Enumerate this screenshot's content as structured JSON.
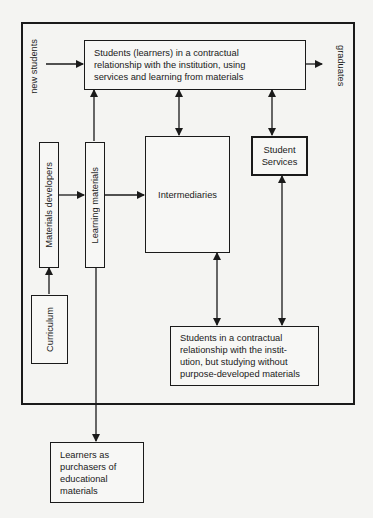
{
  "diagram": {
    "nodes": {
      "enrolled_students": "Students (learners) in a contractual relationship with the institution, using services and learning from materials",
      "intermediaries": "Intermediaries",
      "student_services": "Student Services",
      "materials_developers": "Materials developers",
      "learning_materials": "Learning materials",
      "curriculum": "Curriculum",
      "students_without_materials": "Students in a contractual relationship with the institution, but studying without purpose-developed materials",
      "learners_purchasers": "Learners as purchasers of educational materials"
    },
    "lines": {
      "enrolled_students": [
        "Students (learners) in a contractual",
        "relationship with the institution, using",
        "services and learning from materials"
      ],
      "students_without_materials": [
        "Students in a contractual",
        "relationship with the instit-",
        "ution, but studying without",
        "purpose-developed materials"
      ],
      "learners_purchasers": [
        "Learners as",
        "purchasers of",
        "educational",
        "materials"
      ],
      "student_services": [
        "Student",
        "Services"
      ]
    },
    "edge_labels": {
      "new_students": "new students",
      "graduates": "graduates"
    },
    "edges": [
      {
        "from": "new_students",
        "to": "enrolled_students",
        "type": "arrow"
      },
      {
        "from": "enrolled_students",
        "to": "graduates",
        "type": "arrow"
      },
      {
        "from": "learning_materials",
        "to": "enrolled_students",
        "type": "arrow"
      },
      {
        "from": "enrolled_students",
        "to": "intermediaries",
        "type": "bidirectional"
      },
      {
        "from": "enrolled_students",
        "to": "student_services",
        "type": "bidirectional"
      },
      {
        "from": "curriculum",
        "to": "materials_developers",
        "type": "arrow"
      },
      {
        "from": "materials_developers",
        "to": "learning_materials",
        "type": "arrow"
      },
      {
        "from": "learning_materials",
        "to": "intermediaries",
        "type": "arrow"
      },
      {
        "from": "intermediaries",
        "to": "students_without_materials",
        "type": "bidirectional"
      },
      {
        "from": "student_services",
        "to": "students_without_materials",
        "type": "bidirectional"
      },
      {
        "from": "learning_materials",
        "to": "learners_purchasers",
        "type": "arrow"
      }
    ]
  }
}
